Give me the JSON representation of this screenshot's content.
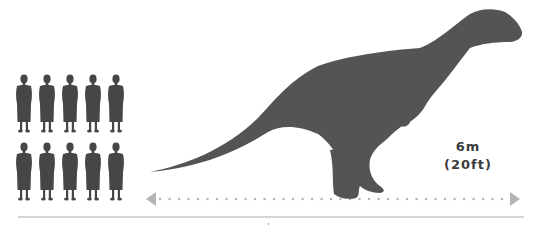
{
  "diagram": {
    "people": {
      "count": 10,
      "rows": 2,
      "columns": 5,
      "color": "#464646"
    },
    "dinosaur": {
      "color": "#545454"
    },
    "measurement": {
      "metric": "6m",
      "imperial": "(20ft)",
      "arrow_color": "#b4b4b4",
      "direction": "horizontal"
    },
    "baseline_color": "#d4d4d4"
  }
}
